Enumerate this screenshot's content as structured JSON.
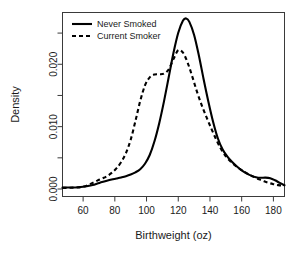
{
  "chart_data": {
    "type": "line",
    "title": "",
    "xlabel": "Birthweight (oz)",
    "ylabel": "Density",
    "xlim": [
      47,
      187
    ],
    "ylim": [
      -0.0012,
      0.0283
    ],
    "grid": false,
    "legend_position": "top-left",
    "xticks": [
      60,
      80,
      100,
      120,
      140,
      160,
      180
    ],
    "xticklabels": [
      "60",
      "80",
      "100",
      "120",
      "140",
      "160",
      "180"
    ],
    "xminorticks": [
      70,
      90,
      110,
      130,
      150,
      170
    ],
    "yticks": [
      0.0,
      0.005,
      0.01,
      0.015,
      0.02,
      0.025
    ],
    "yticklabels": [
      "0.000",
      "",
      "0.010",
      "",
      "0.020",
      ""
    ],
    "ylabeled": [
      0.0,
      0.01,
      0.02
    ],
    "series": [
      {
        "name": "Never Smoked",
        "style": "solid",
        "color": "#000000",
        "x": [
          47,
          52,
          57,
          60,
          63,
          66,
          69,
          72,
          75,
          78,
          81,
          84,
          87,
          90,
          93,
          96,
          99,
          102,
          105,
          108,
          111,
          114,
          117,
          120,
          123,
          125,
          127,
          130,
          133,
          136,
          139,
          142,
          145,
          148,
          151,
          154,
          157,
          160,
          163,
          166,
          169,
          172,
          175,
          178,
          181,
          184,
          187
        ],
        "y": [
          0.00022,
          0.00024,
          0.00028,
          0.00035,
          0.00048,
          0.00065,
          0.00088,
          0.00112,
          0.00133,
          0.00152,
          0.00168,
          0.00185,
          0.00205,
          0.00232,
          0.00268,
          0.00318,
          0.00405,
          0.00545,
          0.00765,
          0.01055,
          0.01405,
          0.01795,
          0.02185,
          0.02505,
          0.027,
          0.02735,
          0.0268,
          0.0247,
          0.0214,
          0.0176,
          0.014,
          0.01075,
          0.0081,
          0.00635,
          0.0052,
          0.00432,
          0.0036,
          0.003,
          0.00252,
          0.00215,
          0.0019,
          0.0018,
          0.00182,
          0.00172,
          0.0014,
          0.00098,
          0.0006
        ]
      },
      {
        "name": "Current Smoker",
        "style": "dashed",
        "color": "#000000",
        "x": [
          47,
          52,
          57,
          60,
          63,
          66,
          69,
          72,
          75,
          78,
          81,
          84,
          87,
          90,
          93,
          96,
          99,
          102,
          105,
          108,
          111,
          114,
          117,
          120,
          123,
          126,
          129,
          132,
          135,
          138,
          141,
          144,
          147,
          150,
          153,
          156,
          159,
          162,
          165,
          168,
          171,
          174,
          177,
          180,
          183,
          187
        ],
        "y": [
          0.00018,
          0.0002,
          0.00026,
          0.00038,
          0.00062,
          0.00098,
          0.00135,
          0.00168,
          0.00205,
          0.00258,
          0.0033,
          0.00432,
          0.00575,
          0.0079,
          0.0109,
          0.0141,
          0.0166,
          0.0179,
          0.01835,
          0.0184,
          0.0185,
          0.0192,
          0.02085,
          0.02225,
          0.02185,
          0.0202,
          0.0179,
          0.01545,
          0.0133,
          0.0114,
          0.0096,
          0.0079,
          0.0064,
          0.00525,
          0.0044,
          0.00375,
          0.0032,
          0.00272,
          0.00228,
          0.0019,
          0.00155,
          0.00125,
          0.00098,
          0.00078,
          0.00062,
          0.00055
        ]
      }
    ]
  },
  "legend": {
    "entries": [
      {
        "label": "Never Smoked",
        "style": "solid"
      },
      {
        "label": "Current Smoker",
        "style": "dashed"
      }
    ]
  },
  "axes": {
    "x_title": "Birthweight (oz)",
    "y_title": "Density"
  }
}
